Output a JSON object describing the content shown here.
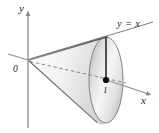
{
  "figure": {
    "kind": "3d-cone-diagram",
    "background_color": "#ffffff",
    "axis_color": "#8a8a8a",
    "outline_color": "#6e6e6e",
    "edge_dark_color": "#4a4a4a",
    "dashed_color": "#7a7a7a",
    "point_color": "#111111",
    "surface_light": "#ffffff",
    "surface_mid": "#e9e9e9",
    "surface_dark": "#bdbdbd",
    "labels": {
      "y_axis": "y",
      "x_axis": "x",
      "origin": "0",
      "line_equation": "y = x",
      "marked_point": "1"
    },
    "geometry": {
      "origin_px": [
        28,
        60
      ],
      "y_axis_tip_px": [
        28,
        10
      ],
      "x_axis_tip_px": [
        150,
        95
      ],
      "cone_apex_px": [
        28,
        60
      ],
      "base_center_px": [
        106,
        80
      ],
      "base_rx_px": 17,
      "base_ry_px": 43,
      "upper_edge_end_px": [
        106,
        37
      ],
      "lower_edge_end_px": [
        98,
        122
      ],
      "marked_point_px": [
        106,
        80
      ],
      "vertical_segment_px": [
        [
          106,
          37
        ],
        [
          106,
          80
        ]
      ],
      "dashed_axis_px": [
        [
          30,
          62
        ],
        [
          112,
          81
        ]
      ],
      "equation_line_px": [
        [
          28,
          60
        ],
        [
          152,
          22
        ]
      ]
    }
  }
}
